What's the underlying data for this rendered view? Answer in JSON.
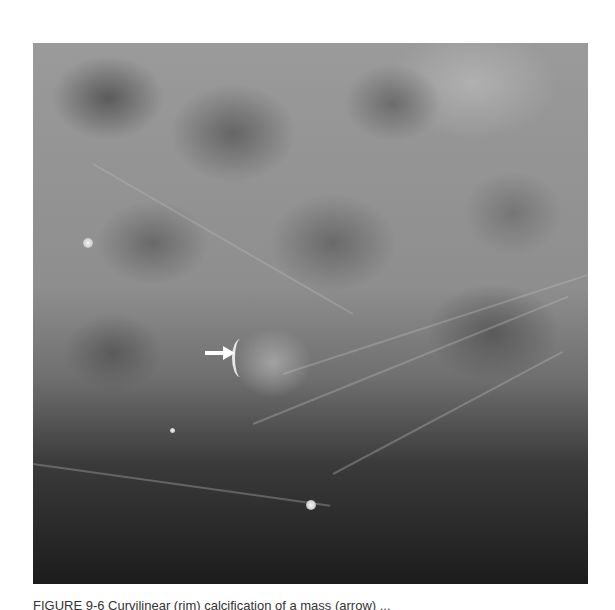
{
  "figure": {
    "type": "mammogram",
    "annotations": [
      {
        "kind": "arrow",
        "direction": "right",
        "color": "#ffffff",
        "points_to": "rim calcification at lesion margin"
      }
    ],
    "features": [
      {
        "name": "punctate-calcification",
        "approx_x": 88,
        "approx_y": 243
      },
      {
        "name": "punctate-calcification",
        "approx_x": 311,
        "approx_y": 505
      },
      {
        "name": "rim-calcification",
        "approx_x": 240,
        "approx_y": 355
      }
    ]
  },
  "caption": {
    "text": "FIGURE 9-6   Curvilinear (rim) calcification of a mass (arrow) ..."
  }
}
